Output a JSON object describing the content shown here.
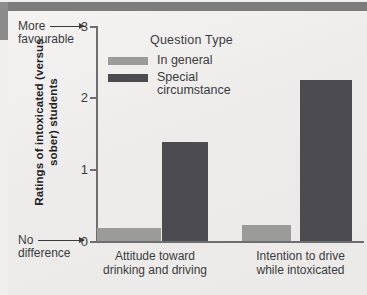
{
  "figure": {
    "background_color": "#f0efee",
    "artifact_band_color": "#7c7c7c"
  },
  "legend": {
    "title": "Question Type",
    "entries": [
      {
        "label": "In general",
        "color": "#9b9b99"
      },
      {
        "label": "Special circumstance",
        "color": "#4b4b50"
      }
    ]
  },
  "axes": {
    "y_title": "Ratings of intoxicated (versus sober) students",
    "y_ticks": [
      "0",
      "1",
      "2",
      "3"
    ],
    "endpoint_high": {
      "line1": "More",
      "line2": "favourable",
      "tick": "3"
    },
    "endpoint_low": {
      "line1": "No",
      "line2": "difference",
      "tick": "0"
    },
    "categories": [
      "Attitude toward drinking and driving",
      "Intention to drive while intoxicated"
    ]
  },
  "chart_data": {
    "type": "bar",
    "title": "",
    "xlabel": "",
    "ylabel": "Ratings of intoxicated (versus sober) students",
    "ylim": [
      0,
      3
    ],
    "yticks": [
      0,
      1,
      2,
      3
    ],
    "grid": false,
    "legend_position": "inside-top-left",
    "categories": [
      "Attitude toward drinking and driving",
      "Intention to drive while intoxicated"
    ],
    "series": [
      {
        "name": "In general",
        "color": "#9b9b99",
        "values": [
          0.18,
          0.22
        ]
      },
      {
        "name": "Special circumstance",
        "color": "#4b4b50",
        "values": [
          1.38,
          2.24
        ]
      }
    ],
    "annotations": [
      {
        "text": "More favourable",
        "at_y": 3
      },
      {
        "text": "No difference",
        "at_y": 0
      }
    ]
  }
}
